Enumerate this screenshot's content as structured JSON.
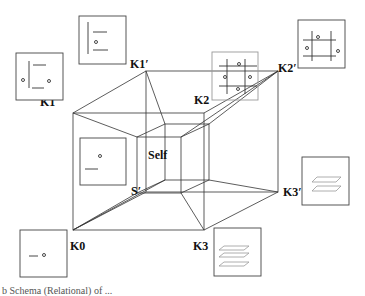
{
  "diagram": {
    "labels": {
      "k0": "K0",
      "k1": "K1",
      "k2": "K2",
      "k3": "K3",
      "k1p": "K1′",
      "k2p": "K2′",
      "k3p": "K3′",
      "self": "Self",
      "sp": "S′"
    },
    "vertices": {
      "K1": [
        73,
        113
      ],
      "K0": [
        73,
        230
      ],
      "K3": [
        204,
        230
      ],
      "K2": [
        204,
        113
      ],
      "K1p": [
        146,
        71
      ],
      "K2p": [
        278,
        71
      ],
      "K3p": [
        278,
        192
      ],
      "Sp": [
        146,
        192
      ]
    },
    "insets": [
      {
        "id": "K1-inset",
        "glyph": "bracket-with-two-dots"
      },
      {
        "id": "K1p-inset",
        "glyph": "bracket-with-one-dot"
      },
      {
        "id": "K2-inset",
        "glyph": "grid-with-four-dots"
      },
      {
        "id": "K2p-inset",
        "glyph": "grid-with-three-dots"
      },
      {
        "id": "K3p-inset",
        "glyph": "two-stacked-planes"
      },
      {
        "id": "K3-inset",
        "glyph": "three-stacked-planes"
      },
      {
        "id": "K0-inset",
        "glyph": "dash-and-dot"
      },
      {
        "id": "self-inset",
        "glyph": "dot-over-dash"
      }
    ]
  },
  "caption": {
    "text": "b  Schema  (Relational)  of  ..."
  }
}
